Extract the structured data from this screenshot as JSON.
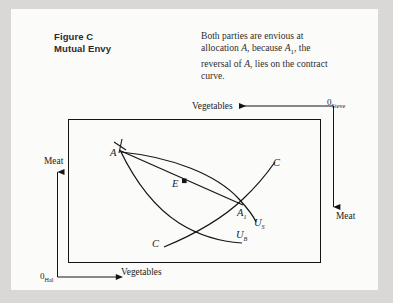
{
  "figure": {
    "heading_line1": "Figure C",
    "heading_line2": "Mutual Envy",
    "caption_line1": "Both parties are envious at",
    "caption_line2_a": "allocation ",
    "caption_line2_b": "A",
    "caption_line2_c": ", because ",
    "caption_line2_d": "A",
    "caption_line2_sub": "1",
    "caption_line2_e": ", the",
    "caption_line3_a": "reversal of ",
    "caption_line3_b": "A",
    "caption_line3_c": ", lies on the contract",
    "caption_line4": "curve."
  },
  "diagram": {
    "type": "edgeworth-box",
    "origin_hal": "0",
    "origin_hal_sub": "Hal",
    "origin_steve": "0",
    "origin_steve_sub": "Steve",
    "axis_vegetables_bottom": "Vegetables",
    "axis_vegetables_top": "Vegetables",
    "axis_meat_left": "Meat",
    "axis_meat_right": "Meat",
    "point_A": "A",
    "point_A1": "A",
    "point_A1_sub": "1",
    "point_E": "E",
    "contract_curve_label_top": "C",
    "contract_curve_label_bottom": "C",
    "indiff_steve": "U",
    "indiff_steve_sub": "S",
    "indiff_hal": "U",
    "indiff_hal_sub": "B",
    "box": {
      "x": 57,
      "y": 110,
      "width": 252,
      "height": 143
    },
    "stroke_color": "#151515",
    "background_color": "#fbfbfa",
    "page_color": "#d9d8d6"
  }
}
